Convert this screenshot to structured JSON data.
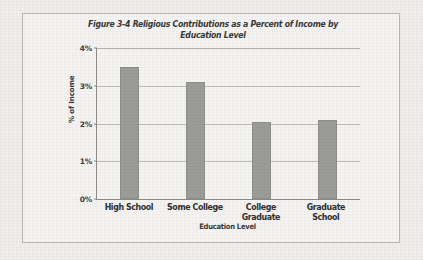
{
  "figure": {
    "title_line_1": "Figure 3-4 Religious Contributions as a Percent of Income by",
    "title_line_2": "Education Level"
  },
  "chart_data": {
    "type": "bar",
    "title": "Figure 3-4 Religious Contributions as a Percent of Income by Education Level",
    "categories": [
      "High School",
      "Some College",
      "College Graduate",
      "Graduate School"
    ],
    "values": [
      3.5,
      3.1,
      2.05,
      2.1
    ],
    "series": [
      {
        "name": "% of Income",
        "values": [
          3.5,
          3.1,
          2.05,
          2.1
        ]
      }
    ],
    "xlabel": "Education Level",
    "ylabel": "% of Income",
    "ylim": [
      0,
      4
    ],
    "ytick_values": [
      0,
      1,
      2,
      3,
      4
    ],
    "ytick_labels": [
      "0%",
      "1%",
      "2%",
      "3%",
      "4%"
    ],
    "grid": true,
    "legend": false,
    "legend_position": "none",
    "bar_color": "#9b9b99",
    "axis_color": "#8d8c8a",
    "gridline_color": "#bdbcba",
    "background_color": "#f4f3f1"
  }
}
